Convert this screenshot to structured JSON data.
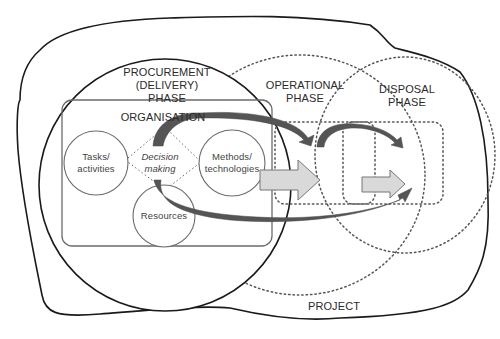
{
  "diagram": {
    "type": "nested-phase-diagram",
    "project": {
      "label": "PROJECT"
    },
    "phases": [
      {
        "id": "procurement",
        "label_lines": [
          "PROCUREMENT",
          "(DELIVERY)",
          "PHASE"
        ],
        "border": "solid"
      },
      {
        "id": "operational",
        "label_lines": [
          "OPERATIONAL",
          "PHASE"
        ],
        "border": "dotted"
      },
      {
        "id": "disposal",
        "label_lines": [
          "DISPOSAL",
          "PHASE"
        ],
        "border": "dotted"
      }
    ],
    "organisation": {
      "label": "ORGANISATION",
      "nodes": [
        {
          "id": "tasks",
          "label_lines": [
            "Tasks/",
            "activities"
          ]
        },
        {
          "id": "methods",
          "label_lines": [
            "Methods/",
            "technologies"
          ]
        },
        {
          "id": "resources",
          "label_lines": [
            "Resources"
          ]
        }
      ],
      "center": {
        "label_lines": [
          "Decision",
          "making"
        ],
        "style": "italic"
      }
    },
    "colors": {
      "outline": "#1a1a1a",
      "inner_outline": "#6b6b6b",
      "dotted": "#555555",
      "dark_arrow": "#555555",
      "block_arrow_fill": "#d9d9d9",
      "block_arrow_stroke": "#777777"
    }
  }
}
